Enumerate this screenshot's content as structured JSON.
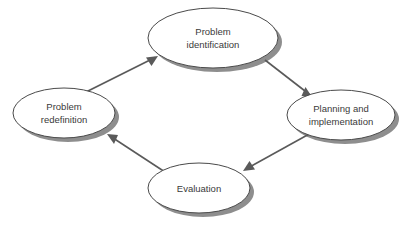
{
  "diagram": {
    "background_color": "#ffffff",
    "node_fill": "#ffffff",
    "node_stroke": "#4a4a4a",
    "shadow_color": "#8e8e8e",
    "edge_color": "#5a5a5a",
    "text_color": "#3a3a3a",
    "nodes": [
      {
        "id": "problem-identification",
        "line1": "Problem",
        "line2": "identification",
        "cx": 213,
        "cy": 38,
        "rx": 65,
        "ry": 30
      },
      {
        "id": "planning-and-implementation",
        "line1": "Planning and",
        "line2": "implementation",
        "cx": 341,
        "cy": 115,
        "rx": 54,
        "ry": 25
      },
      {
        "id": "evaluation",
        "line1": "Evaluation",
        "line2": "",
        "cx": 199,
        "cy": 188,
        "rx": 51,
        "ry": 25
      },
      {
        "id": "problem-redefinition",
        "line1": "Problem",
        "line2": "redefinition",
        "cx": 64,
        "cy": 113,
        "rx": 51,
        "ry": 25
      }
    ],
    "edges": [
      {
        "id": "redefinition-to-identification",
        "from": "problem-redefinition",
        "to": "problem-identification",
        "x1": 86,
        "y1": 92,
        "x2": 158,
        "y2": 56
      },
      {
        "id": "identification-to-planning",
        "from": "problem-identification",
        "to": "planning-and-implementation",
        "x1": 265,
        "y1": 60,
        "x2": 312,
        "y2": 97
      },
      {
        "id": "planning-to-evaluation",
        "from": "planning-and-implementation",
        "to": "evaluation",
        "x1": 311,
        "y1": 133,
        "x2": 243,
        "y2": 171
      },
      {
        "id": "evaluation-to-redefinition",
        "from": "evaluation",
        "to": "problem-redefinition",
        "x1": 165,
        "y1": 172,
        "x2": 107,
        "y2": 134
      }
    ]
  }
}
